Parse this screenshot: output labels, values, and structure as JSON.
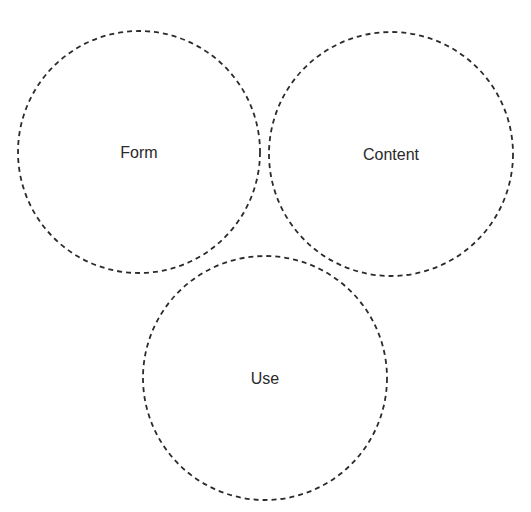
{
  "diagram": {
    "type": "three-circle dashed diagram",
    "stroke_color": "#2b2b2b",
    "text_color": "#2a2a2a",
    "background": "#ffffff",
    "nodes": [
      {
        "id": "form",
        "label": "Form",
        "cx": 139,
        "cy": 152,
        "r": 121
      },
      {
        "id": "content",
        "label": "Content",
        "cx": 391,
        "cy": 154,
        "r": 122
      },
      {
        "id": "use",
        "label": "Use",
        "cx": 265,
        "cy": 378,
        "r": 122
      }
    ]
  }
}
